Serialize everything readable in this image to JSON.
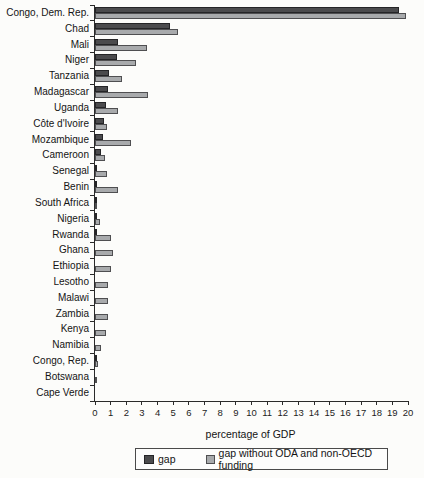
{
  "figure": {
    "background": "#fcfcfa"
  },
  "chart_data": {
    "type": "bar",
    "orientation": "horizontal",
    "title": "",
    "xlabel": "percentage of GDP",
    "xlim": [
      0,
      20
    ],
    "x_ticks": [
      0,
      1,
      2,
      3,
      4,
      5,
      6,
      7,
      8,
      9,
      10,
      11,
      12,
      13,
      14,
      15,
      16,
      17,
      18,
      19,
      20
    ],
    "grid": false,
    "legend_position": "bottom",
    "categories": [
      "Congo, Dem. Rep.",
      "Chad",
      "Mali",
      "Niger",
      "Tanzania",
      "Madagascar",
      "Uganda",
      "Côte d'Ivoire",
      "Mozambique",
      "Cameroon",
      "Senegal",
      "Benin",
      "South Africa",
      "Nigeria",
      "Rwanda",
      "Ghana",
      "Ethiopia",
      "Lesotho",
      "Malawi",
      "Zambia",
      "Kenya",
      "Namibia",
      "Congo, Rep.",
      "Botswana",
      "Cape Verde"
    ],
    "series": [
      {
        "name": "gap",
        "color": "#4b4b4d",
        "border_color": "#252527",
        "values": [
          19.4,
          4.8,
          1.5,
          1.4,
          0.9,
          0.8,
          0.7,
          0.6,
          0.5,
          0.4,
          0.15,
          0.1,
          0.1,
          0.1,
          0.05,
          0,
          0,
          0,
          0,
          0,
          0,
          0,
          0.05,
          0,
          0
        ]
      },
      {
        "name": "gap without ODA and non-OECD funding",
        "color": "#a8aaac",
        "border_color": "#4f4f51",
        "values": [
          19.9,
          5.3,
          3.3,
          2.6,
          1.7,
          3.4,
          1.5,
          0.75,
          2.3,
          0.65,
          0.75,
          1.45,
          0.12,
          0.3,
          1.0,
          1.15,
          1.0,
          0.8,
          0.85,
          0.8,
          0.7,
          0.4,
          0.2,
          0.05,
          0
        ]
      }
    ]
  }
}
